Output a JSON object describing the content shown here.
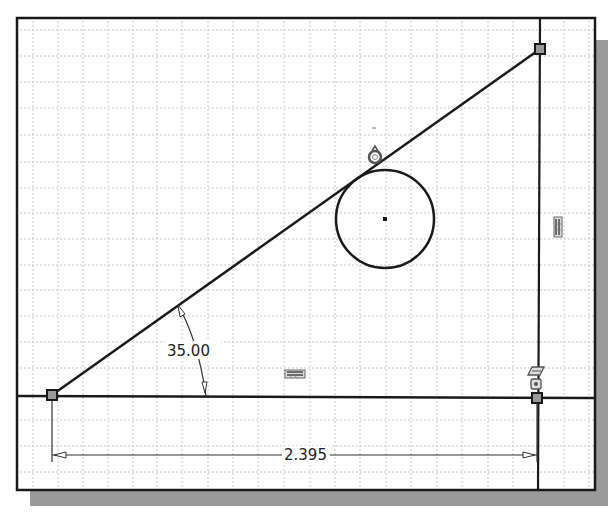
{
  "sketch": {
    "grid": {
      "spacing_px": 25.5,
      "color": "#c8c8c8"
    },
    "colors": {
      "geometry": "#1a1a1a",
      "frame": "#1a1a1a",
      "shadow": "#9a9a9a",
      "constraint_icon": "#555555"
    },
    "dimensions": {
      "angle": {
        "value": "35.00",
        "unit": "deg"
      },
      "linear": {
        "value": "2.395"
      }
    },
    "entities": {
      "points": [
        {
          "name": "left-endpoint",
          "x": 52,
          "y": 395
        },
        {
          "name": "top-right-endpoint",
          "x": 540,
          "y": 49
        },
        {
          "name": "bottom-right-endpoint",
          "x": 537,
          "y": 398
        }
      ],
      "circle": {
        "cx": 385,
        "cy": 219,
        "r": 49
      },
      "tangent_constraint_at": {
        "x": 375,
        "y": 157
      }
    },
    "constraint_icons": [
      "tangent-icon",
      "vertical-icon",
      "horizontal-icon",
      "parallel-icon",
      "coincident-icon"
    ]
  }
}
